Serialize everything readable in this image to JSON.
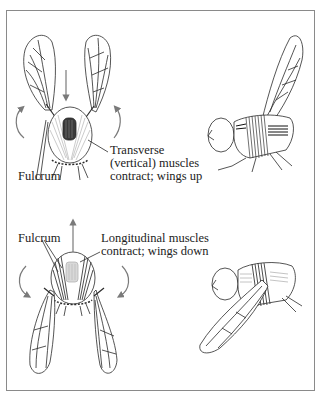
{
  "figure": {
    "top_panel": {
      "title": "Wings up (upstroke)",
      "front_view_labels": {
        "fulcrum": "Fulcrum",
        "muscle_caption": [
          "Transverse",
          "(vertical) muscles",
          "contract; wings up"
        ]
      }
    },
    "bottom_panel": {
      "title": "Wings down (downstroke)",
      "front_view_labels": {
        "fulcrum": "Fulcrum",
        "muscle_caption": [
          "Longitudinal muscles",
          "contract; wings down"
        ]
      }
    },
    "colors": {
      "line": "#2a2a2a",
      "arrow": "#7a7a7a",
      "muscle_dark": "#3a3a3a",
      "muscle_light": "#b5b5b5",
      "frame": "#8a8a8a"
    }
  }
}
